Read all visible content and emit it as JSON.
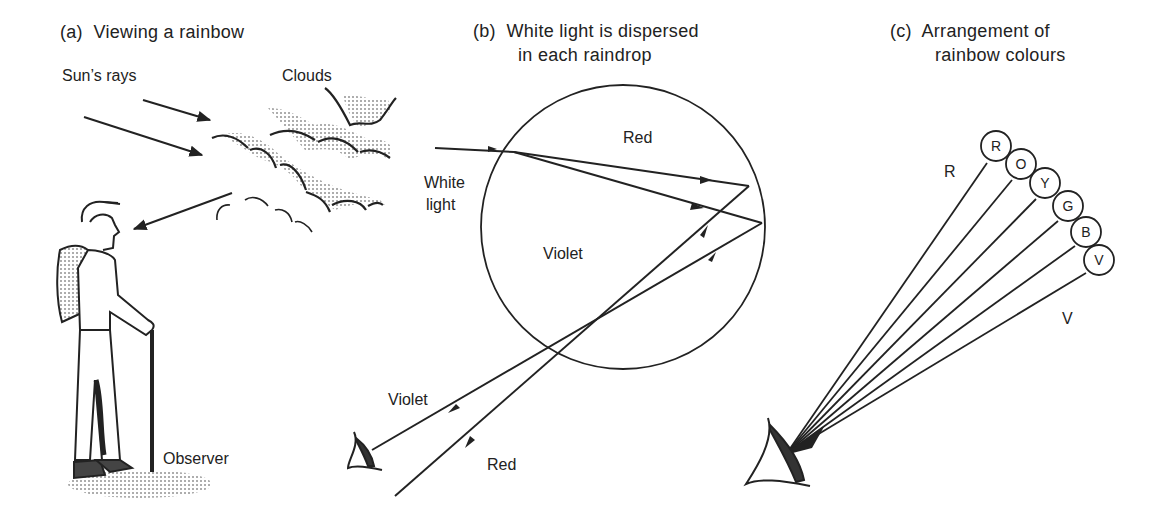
{
  "panels": {
    "a": {
      "title": "(a)  Viewing a rainbow",
      "labels": {
        "sun_rays": "Sun’s rays",
        "clouds": "Clouds",
        "observer": "Observer"
      }
    },
    "b": {
      "title_line1": "(b)  White light is dispersed",
      "title_line2": "in each raindrop",
      "labels": {
        "white_light_1": "White",
        "white_light_2": "light",
        "red_inside": "Red",
        "violet_inside": "Violet",
        "violet_out": "Violet",
        "red_out": "Red"
      }
    },
    "c": {
      "title_line1": "(c)  Arrangement of",
      "title_line2": "rainbow colours",
      "labels": {
        "r_edge": "R",
        "v_edge": "V"
      },
      "colour_circles": [
        "R",
        "O",
        "Y",
        "G",
        "B",
        "V"
      ]
    }
  }
}
